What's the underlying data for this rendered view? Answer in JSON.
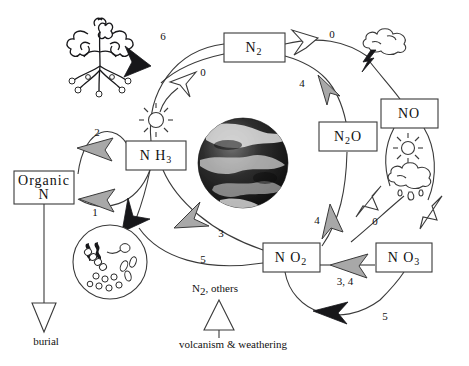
{
  "diagram": {
    "nodes": [
      {
        "id": "n2",
        "label": "N2",
        "main": "N",
        "sub": "2",
        "tail": "",
        "x": 254,
        "y": 47
      },
      {
        "id": "no",
        "label": "NO",
        "main": "NO",
        "sub": "",
        "tail": "",
        "x": 409,
        "y": 113
      },
      {
        "id": "n2o",
        "label": "N2O",
        "main": "N",
        "sub": "2",
        "tail": "O",
        "x": 348,
        "y": 136
      },
      {
        "id": "nh3",
        "label": "NH3",
        "main": "N H",
        "sub": "3",
        "tail": "",
        "x": 155,
        "y": 155
      },
      {
        "id": "organicn",
        "label": "Organic N",
        "main": "Organic",
        "sub": "",
        "tail": "N",
        "x": 40,
        "y": 190
      },
      {
        "id": "no2",
        "label": "NO2",
        "main": "N O",
        "sub": "2",
        "tail": "",
        "x": 291,
        "y": 258
      },
      {
        "id": "no3",
        "label": "NO3",
        "main": "N O",
        "sub": "3",
        "tail": "",
        "x": 404,
        "y": 258
      }
    ],
    "flux_labels": [
      {
        "id": "flux-6",
        "text": "6",
        "x": 163,
        "y": 40
      },
      {
        "id": "flux-0-nh3-n2",
        "text": "0",
        "x": 203,
        "y": 76
      },
      {
        "id": "flux-0-n2-no",
        "text": "0",
        "x": 332,
        "y": 38
      },
      {
        "id": "flux-4-n2o-n2",
        "text": "4",
        "x": 302,
        "y": 87
      },
      {
        "id": "flux-2",
        "text": "2",
        "x": 97,
        "y": 136
      },
      {
        "id": "flux-1",
        "text": "1",
        "x": 95,
        "y": 216
      },
      {
        "id": "flux-3",
        "text": "3",
        "x": 221,
        "y": 237
      },
      {
        "id": "flux-5-left",
        "text": "5",
        "x": 203,
        "y": 263
      },
      {
        "id": "flux-4-no2-n2o",
        "text": "4",
        "x": 317,
        "y": 224
      },
      {
        "id": "flux-0-no3",
        "text": "0",
        "x": 375,
        "y": 225
      },
      {
        "id": "flux-3-4",
        "text": "3, 4",
        "x": 345,
        "y": 285
      },
      {
        "id": "flux-5-bottom",
        "text": "5",
        "x": 385,
        "y": 320
      }
    ],
    "captions": [
      {
        "id": "burial-label",
        "text": "burial",
        "x": 46,
        "y": 345
      },
      {
        "id": "volcanism-label",
        "text": "volcanism & weathering",
        "x": 233,
        "y": 348
      },
      {
        "id": "n2-others-label",
        "main": "N",
        "sub": "2",
        "tail": ", others",
        "x": 215,
        "y": 292
      }
    ],
    "icons": [
      {
        "id": "plant-icon",
        "name": "plant-icon",
        "x": 100,
        "y": 55
      },
      {
        "id": "sun-icon-left",
        "name": "sun-icon",
        "x": 156,
        "y": 120
      },
      {
        "id": "lightning-cloud-icon",
        "name": "lightning-cloud-icon",
        "x": 383,
        "y": 45
      },
      {
        "id": "sun-icon-right",
        "name": "sun-icon",
        "x": 408,
        "y": 148
      },
      {
        "id": "rain-cloud-icon",
        "name": "rain-cloud-icon",
        "x": 410,
        "y": 180
      },
      {
        "id": "earth-icon",
        "name": "earth-globe-icon",
        "x": 243,
        "y": 163
      },
      {
        "id": "microbes-icon",
        "name": "microbes-circle-icon",
        "x": 110,
        "y": 262
      }
    ],
    "colors": {
      "stroke": "#3a3a3a",
      "arrow_black": "#17171a",
      "arrow_gray": "#a8a8a8",
      "arrow_open": "#ffffff",
      "background": "#ffffff"
    }
  }
}
